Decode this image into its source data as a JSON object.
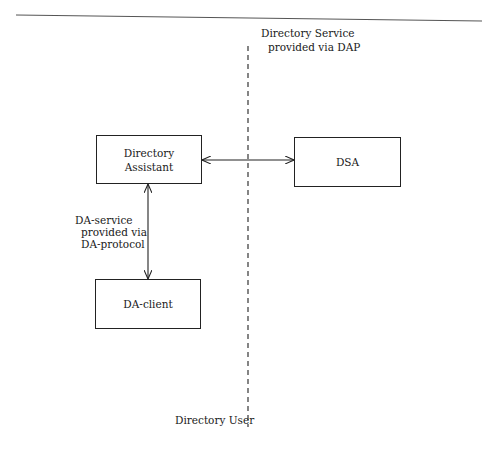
{
  "diagram": {
    "boundary": {
      "top_label": [
        "Directory Service",
        "provided via DAP"
      ],
      "bottom_label": "Directory User"
    },
    "nodes": [
      {
        "id": "directory-assistant",
        "lines": [
          "Directory",
          "Assistant"
        ]
      },
      {
        "id": "dsa",
        "lines": [
          "DSA"
        ]
      },
      {
        "id": "da-client",
        "lines": [
          "DA-client"
        ]
      }
    ],
    "edges": [
      {
        "from": "directory-assistant",
        "to": "dsa",
        "type": "bidirectional",
        "label": ""
      },
      {
        "from": "directory-assistant",
        "to": "da-client",
        "type": "bidirectional",
        "label": [
          "DA-service",
          "provided via",
          "DA-protocol"
        ]
      }
    ]
  },
  "labels": {
    "ds_line1": "Directory Service",
    "ds_line2": "provided via DAP",
    "directory_user": "Directory User",
    "da_assistant_line1": "Directory",
    "da_assistant_line2": "Assistant",
    "dsa": "DSA",
    "da_client": "DA-client",
    "da_service_line1": "DA-service",
    "da_service_line2": "provided via",
    "da_service_line3": "DA-protocol"
  },
  "colors": {
    "line": "#222222",
    "background": "#ffffff"
  }
}
